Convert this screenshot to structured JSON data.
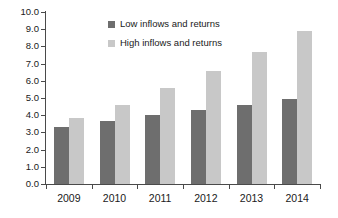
{
  "chart_data": {
    "type": "bar",
    "title": "",
    "subtitle": "",
    "xlabel": "",
    "ylabel": "",
    "categories": [
      "2009",
      "2010",
      "2011",
      "2012",
      "2013",
      "2014"
    ],
    "series": [
      {
        "name": "Low inflows and returns",
        "color": "#6e6e6e",
        "values": [
          3.3,
          3.65,
          4.0,
          4.3,
          4.6,
          4.95
        ]
      },
      {
        "name": "High inflows and returns",
        "color": "#c8c8c8",
        "values": [
          3.85,
          4.6,
          5.6,
          6.55,
          7.7,
          8.9
        ]
      }
    ],
    "ylim": [
      0.0,
      10.0
    ],
    "ytick_step": 1.0,
    "ytick_labels": [
      "0.0",
      "1.0",
      "2.0",
      "3.0",
      "4.0",
      "5.0",
      "6.0",
      "7.0",
      "8.0",
      "9.0",
      "10.0"
    ],
    "grid": false,
    "legend_position": "inside-upper-left",
    "annotations": []
  },
  "colors": {
    "background": "#ffffff",
    "axis": "#4a4a4a",
    "text": "#1a1a1a",
    "series_low": "#6e6e6e",
    "series_high": "#c8c8c8"
  }
}
